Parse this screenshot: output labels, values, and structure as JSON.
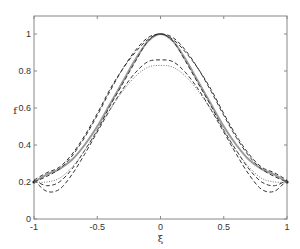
{
  "chart_data": {
    "type": "line",
    "title": "",
    "xlabel": "ξ",
    "ylabel": "f",
    "xlim": [
      -1,
      1
    ],
    "ylim": [
      0,
      1.1
    ],
    "grid": false,
    "legend": null,
    "x_ticks": [
      -1,
      -0.5,
      0,
      0.5,
      1
    ],
    "x_tick_labels": [
      "-1",
      "-0.5",
      "0",
      "0.5",
      "1"
    ],
    "y_ticks": [
      0,
      0.2,
      0.4,
      0.6,
      0.8,
      1
    ],
    "y_tick_labels": [
      "0",
      "0.2",
      "0.4",
      "0.6",
      "0.8",
      "1"
    ],
    "x": [
      -1,
      -0.9,
      -0.8,
      -0.7,
      -0.6,
      -0.5,
      -0.4,
      -0.3,
      -0.2,
      -0.1,
      0,
      0.1,
      0.2,
      0.3,
      0.4,
      0.5,
      0.6,
      0.7,
      0.8,
      0.9,
      1
    ],
    "series": [
      {
        "name": "exact",
        "style": "solid",
        "color": "#999999",
        "width": 2,
        "values": [
          0.2,
          0.24,
          0.27,
          0.32,
          0.4,
          0.5,
          0.62,
          0.74,
          0.86,
          0.96,
          1.0,
          0.96,
          0.86,
          0.74,
          0.62,
          0.5,
          0.4,
          0.32,
          0.27,
          0.24,
          0.2
        ]
      },
      {
        "name": "approx-1",
        "style": "dashed",
        "color": "#333333",
        "width": 1,
        "values": [
          0.2,
          0.23,
          0.27,
          0.34,
          0.44,
          0.56,
          0.69,
          0.81,
          0.91,
          0.98,
          1.0,
          0.98,
          0.91,
          0.81,
          0.69,
          0.56,
          0.44,
          0.34,
          0.27,
          0.23,
          0.2
        ]
      },
      {
        "name": "approx-2",
        "style": "dashed",
        "color": "#333333",
        "width": 1,
        "values": [
          0.21,
          0.25,
          0.28,
          0.35,
          0.45,
          0.57,
          0.7,
          0.81,
          0.9,
          0.97,
          1.0,
          0.97,
          0.9,
          0.81,
          0.7,
          0.57,
          0.45,
          0.35,
          0.28,
          0.25,
          0.21
        ]
      },
      {
        "name": "approx-3",
        "style": "dashed",
        "color": "#333333",
        "width": 1,
        "values": [
          0.21,
          0.18,
          0.2,
          0.27,
          0.37,
          0.48,
          0.61,
          0.73,
          0.85,
          0.96,
          1.0,
          0.96,
          0.85,
          0.73,
          0.61,
          0.48,
          0.37,
          0.27,
          0.2,
          0.18,
          0.21
        ]
      },
      {
        "name": "approx-4",
        "style": "dashed",
        "color": "#333333",
        "width": 1,
        "values": [
          0.21,
          0.15,
          0.16,
          0.24,
          0.35,
          0.47,
          0.59,
          0.7,
          0.79,
          0.85,
          0.86,
          0.85,
          0.79,
          0.7,
          0.59,
          0.47,
          0.35,
          0.24,
          0.16,
          0.15,
          0.21
        ]
      },
      {
        "name": "approx-5",
        "style": "dotted",
        "color": "#777777",
        "width": 1,
        "values": [
          0.2,
          0.2,
          0.22,
          0.28,
          0.37,
          0.48,
          0.59,
          0.69,
          0.77,
          0.82,
          0.83,
          0.82,
          0.77,
          0.69,
          0.59,
          0.48,
          0.37,
          0.28,
          0.22,
          0.2,
          0.2
        ]
      }
    ]
  },
  "layout": {
    "plot_left": 34,
    "plot_right": 287,
    "plot_top": 16,
    "plot_bottom": 219,
    "axis_color": "#888888"
  }
}
